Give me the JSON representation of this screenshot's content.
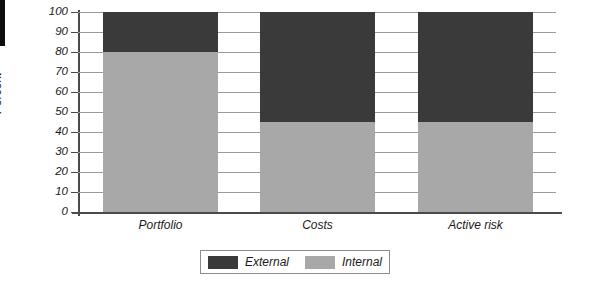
{
  "chart_data": {
    "type": "bar",
    "subtype": "stacked-bar-100",
    "title": "",
    "xlabel": "",
    "ylabel": "Percent",
    "ylim": [
      0,
      100
    ],
    "ytick_step": 10,
    "ytick_labels": [
      "100",
      "90",
      "80",
      "70",
      "60",
      "50",
      "40",
      "30",
      "20",
      "10",
      "0"
    ],
    "grid": true,
    "grid_axis": "y",
    "legend_position": "bottom-center",
    "categories": [
      "Portfolio",
      "Costs",
      "Active risk"
    ],
    "series": [
      {
        "name": "External",
        "color": "#3a3a3a",
        "values": [
          20,
          55,
          55
        ]
      },
      {
        "name": "Internal",
        "color": "#a8a8a8",
        "values": [
          80,
          45,
          45
        ]
      }
    ]
  },
  "colors": {
    "external": "#3a3a3a",
    "internal": "#a8a8a8",
    "axis": "#4a4a4a",
    "grid": "#9b9b9b",
    "text": "#1a1a1a",
    "background": "#ffffff",
    "legend_border": "#8d8d8d"
  }
}
